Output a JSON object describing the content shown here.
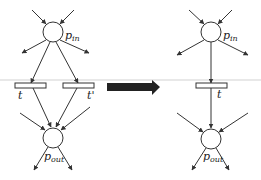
{
  "diagram": {
    "type": "petri-net-reduction",
    "colors": {
      "stroke": "#333333",
      "arrow_fill": "#222222",
      "background": "#ffffff"
    },
    "left": {
      "place_in": {
        "label": "p",
        "sub": "in"
      },
      "transitions": [
        {
          "label": "t"
        },
        {
          "label": "t'"
        }
      ],
      "place_out": {
        "label": "p",
        "sub": "out"
      }
    },
    "arrow": {
      "meaning": "transforms-into"
    },
    "right": {
      "place_in": {
        "label": "p",
        "sub": "in"
      },
      "transitions": [
        {
          "label": "t"
        }
      ],
      "place_out": {
        "label": "p",
        "sub": "out"
      }
    }
  }
}
